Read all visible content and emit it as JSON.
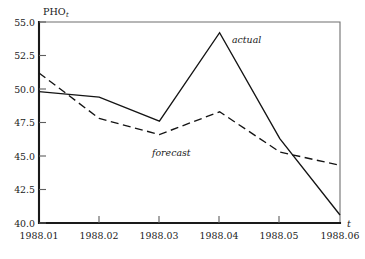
{
  "chart_data": {
    "type": "line",
    "title": "",
    "subtitle": "",
    "xlabel": "t",
    "ylabel": "PHO",
    "ylabel_subscript": "t",
    "x": [
      "1988.01",
      "1988.02",
      "1988.03",
      "1988.04",
      "1988.05",
      "1988.06"
    ],
    "categories": [
      "1988.01",
      "1988.02",
      "1988.03",
      "1988.04",
      "1988.05",
      "1988.06"
    ],
    "series": [
      {
        "name": "actual",
        "style": "solid",
        "values": [
          49.8,
          49.4,
          47.6,
          54.2,
          46.3,
          40.6
        ]
      },
      {
        "name": "forecast",
        "style": "dashed",
        "values": [
          51.2,
          47.8,
          46.6,
          48.3,
          45.3,
          44.3
        ]
      }
    ],
    "ylim": [
      40.0,
      55.0
    ],
    "xlim": [
      "1988.01",
      "1988.06"
    ],
    "yticks": [
      40.0,
      42.5,
      45.0,
      47.5,
      50.0,
      52.5,
      55.0
    ],
    "ytick_labels": [
      "40.0",
      "42.5",
      "45.0",
      "47.5",
      "50.0",
      "52.5",
      "55.0"
    ],
    "xtick_labels": [
      "1988.01",
      "1988.02",
      "1988.03",
      "1988.04",
      "1988.05",
      "1988.06"
    ],
    "grid": false,
    "legend": "inline-annotations",
    "annotations": [
      {
        "text": "actual",
        "series": "actual"
      },
      {
        "text": "forecast",
        "series": "forecast"
      }
    ]
  },
  "colors": {
    "axis": "#1a1a1a",
    "frame": "#6f6f6f",
    "series_actual": "#141414",
    "series_forecast": "#141414",
    "background": "#ffffff"
  }
}
